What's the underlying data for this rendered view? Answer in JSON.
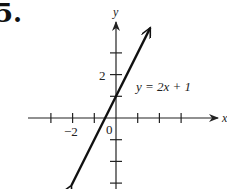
{
  "problem": {
    "number": "5."
  },
  "chart_data": {
    "type": "line",
    "title": "",
    "xlabel": "x",
    "ylabel": "y",
    "equation_label": "y = 2x + 1",
    "xlim": [
      -3.5,
      4.8
    ],
    "ylim": [
      -3.2,
      5
    ],
    "x_ticks": [
      -3,
      -2,
      -1,
      1,
      2,
      3
    ],
    "y_ticks": [
      -3,
      -2,
      -1,
      1,
      2,
      3
    ],
    "tick_labels": {
      "x": [
        {
          "value": -2,
          "label": "−2"
        }
      ],
      "y": [
        {
          "value": 2,
          "label": "2"
        }
      ],
      "origin": "0"
    },
    "series": [
      {
        "name": "y = 2x + 1",
        "slope": 2,
        "intercept": 1,
        "x": [
          -2.05,
          1.58
        ],
        "y": [
          -3.1,
          4.16
        ]
      }
    ],
    "grid": false,
    "legend": "none"
  },
  "colors": {
    "line": "#111111",
    "axes": "#222222",
    "background": "#ffffff"
  }
}
